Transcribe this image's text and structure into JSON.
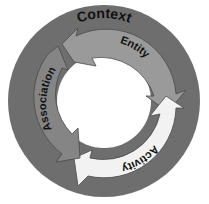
{
  "diagram": {
    "type": "cycle",
    "outer_ring": {
      "label": "Context",
      "color": "#6e6e6e"
    },
    "arrows": [
      {
        "label": "Entity",
        "color": "#9a9a9a"
      },
      {
        "label": "Activity",
        "color": "#f2f2f2"
      },
      {
        "label": "Association",
        "color": "#858585"
      }
    ]
  }
}
